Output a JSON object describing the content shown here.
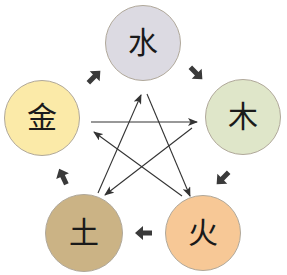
{
  "diagram": {
    "type": "five-elements-cycle",
    "nodes": [
      {
        "id": "water",
        "label": "水",
        "cx": 143,
        "cy": 43,
        "r": 38,
        "color": "#dcdae2"
      },
      {
        "id": "wood",
        "label": "木",
        "cx": 243,
        "cy": 117,
        "r": 38,
        "color": "#dfe6c9"
      },
      {
        "id": "fire",
        "label": "火",
        "cx": 203,
        "cy": 233,
        "r": 38,
        "color": "#f7c896"
      },
      {
        "id": "earth",
        "label": "土",
        "cx": 84,
        "cy": 233,
        "r": 39,
        "color": "#cbb385"
      },
      {
        "id": "metal",
        "label": "金",
        "cx": 42,
        "cy": 118,
        "r": 38,
        "color": "#fbeaa8"
      }
    ],
    "generating_cycle": [
      {
        "from": "metal",
        "to": "water"
      },
      {
        "from": "water",
        "to": "wood"
      },
      {
        "from": "wood",
        "to": "fire"
      },
      {
        "from": "fire",
        "to": "earth"
      },
      {
        "from": "earth",
        "to": "metal"
      }
    ],
    "controlling_cycle": [
      {
        "from": "metal",
        "to": "wood"
      },
      {
        "from": "wood",
        "to": "earth"
      },
      {
        "from": "earth",
        "to": "water"
      },
      {
        "from": "water",
        "to": "fire"
      },
      {
        "from": "fire",
        "to": "metal"
      }
    ],
    "colors": {
      "thick_arrow": "#3a3a3a",
      "thin_arrow": "#333333",
      "border": "#b0a89a"
    }
  }
}
